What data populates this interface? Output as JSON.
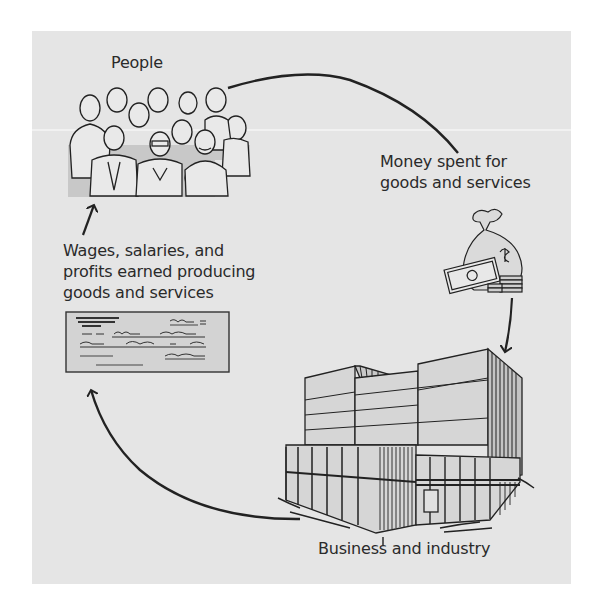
{
  "diagram": {
    "type": "circular-flow",
    "colors": {
      "background": "#ffffff",
      "panel": "#e5e5e5",
      "ink": "#222222",
      "illustration_fill": "#d2d2d2"
    },
    "nodes": {
      "people": {
        "label": "People",
        "icon": "crowd-of-people-icon"
      },
      "money": {
        "lines": [
          "Money spent for",
          "goods and services"
        ],
        "icon": "money-bag-icon"
      },
      "business": {
        "label": "Business and industry",
        "icon": "office-building-icon"
      },
      "wages": {
        "lines": [
          "Wages, salaries, and",
          "profits earned producing",
          "goods and services"
        ],
        "icon": "paycheck-icon"
      }
    },
    "flows": [
      {
        "from": "People",
        "to": "Business and industry",
        "via": "Money spent for goods and services"
      },
      {
        "from": "Business and industry",
        "to": "People",
        "via": "Wages, salaries, and profits earned producing goods and services"
      }
    ]
  }
}
